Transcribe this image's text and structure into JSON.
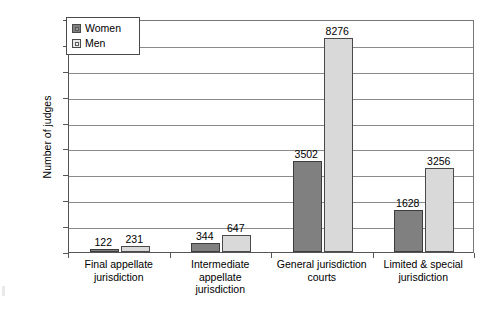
{
  "chart_data": {
    "type": "bar",
    "title": "",
    "xlabel": "",
    "ylabel": "Number of judges",
    "ylim": [
      0,
      9000
    ],
    "ytick_step": 1000,
    "grid": true,
    "legend_position": "top-left",
    "categories": [
      "Final appellate jurisdiction",
      "Intermediate appellate jurisdiction",
      "General jurisdiction courts",
      "Limited & special jurisdiction"
    ],
    "category_lines": [
      [
        "Final appellate",
        "jurisdiction"
      ],
      [
        "Intermediate",
        "appellate",
        "jurisdiction"
      ],
      [
        "General jurisdiction",
        "courts"
      ],
      [
        "Limited & special",
        "jurisdiction"
      ]
    ],
    "series": [
      {
        "name": "Women",
        "color": "#808080",
        "values": [
          122,
          344,
          3502,
          1628
        ]
      },
      {
        "name": "Men",
        "color": "#d9d9d9",
        "values": [
          231,
          647,
          8276,
          3256
        ]
      }
    ],
    "ytick_labels": [
      "0",
      "1000",
      "2000",
      "3000",
      "4000",
      "5000",
      "6000",
      "7000",
      "8000",
      "9000"
    ],
    "data_labels": [
      "122",
      "231",
      "344",
      "647",
      "3502",
      "8276",
      "1628",
      "3256"
    ]
  },
  "legend": {
    "items": [
      {
        "label": "Women"
      },
      {
        "label": "Men"
      }
    ]
  },
  "axis": {
    "y_title": "Number of judges"
  }
}
